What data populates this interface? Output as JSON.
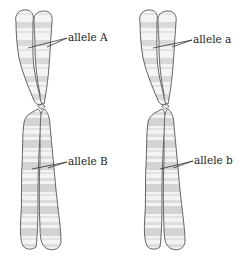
{
  "figure": {
    "chromosomes": [
      {
        "id": "left",
        "labels": {
          "upper": "allele A",
          "lower": "allele B"
        }
      },
      {
        "id": "right",
        "labels": {
          "upper": "allele a",
          "lower": "allele b"
        }
      }
    ],
    "colors": {
      "outline": "#555555",
      "fill_light": "#f2f2f2",
      "band": "#d4d4d4",
      "leader": "#333333",
      "text": "#222222"
    }
  }
}
